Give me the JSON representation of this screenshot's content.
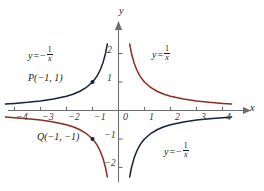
{
  "chart_data": {
    "type": "line",
    "title": "",
    "xlabel": "x",
    "ylabel": "y",
    "xlim": [
      -4.3,
      4.4
    ],
    "ylim": [
      -2.4,
      2.5
    ],
    "grid": false,
    "legend": "none",
    "xticks": [
      -4,
      -3,
      -2,
      -1,
      0,
      1,
      2,
      3,
      4
    ],
    "xtick_labels": [
      "−4",
      "−3",
      "−2",
      "−1",
      "0",
      "1",
      "2",
      "3",
      "4"
    ],
    "yticks": [
      -2,
      -1,
      1,
      2
    ],
    "ytick_labels": [
      "−2",
      "−1",
      "1",
      "2"
    ],
    "series": [
      {
        "name": "y = 1/x",
        "color": "#8e2b22",
        "branch": "x>0",
        "x": [
          0.43,
          0.5,
          0.6,
          0.7,
          0.8,
          0.9,
          1.0,
          1.25,
          1.5,
          1.75,
          2.0,
          2.5,
          3.0,
          3.5,
          4.0,
          4.35
        ],
        "y": [
          2.33,
          2.0,
          1.667,
          1.429,
          1.25,
          1.111,
          1.0,
          0.8,
          0.667,
          0.571,
          0.5,
          0.4,
          0.333,
          0.286,
          0.25,
          0.23
        ]
      },
      {
        "name": "y = 1/x",
        "color": "#8e2b22",
        "branch": "x<0",
        "x": [
          -4.35,
          -4.0,
          -3.5,
          -3.0,
          -2.5,
          -2.0,
          -1.75,
          -1.5,
          -1.25,
          -1.0,
          -0.9,
          -0.8,
          -0.7,
          -0.6,
          -0.5,
          -0.43
        ],
        "y": [
          -0.23,
          -0.25,
          -0.286,
          -0.333,
          -0.4,
          -0.5,
          -0.571,
          -0.667,
          -0.8,
          -1.0,
          -1.111,
          -1.25,
          -1.429,
          -1.667,
          -2.0,
          -2.33
        ]
      },
      {
        "name": "y = -1/x",
        "color": "#16213c",
        "branch": "x<0",
        "x": [
          -4.35,
          -4.0,
          -3.5,
          -3.0,
          -2.5,
          -2.0,
          -1.75,
          -1.5,
          -1.25,
          -1.0,
          -0.9,
          -0.8,
          -0.7,
          -0.6,
          -0.5,
          -0.43
        ],
        "y": [
          0.23,
          0.25,
          0.286,
          0.333,
          0.4,
          0.5,
          0.571,
          0.667,
          0.8,
          1.0,
          1.111,
          1.25,
          1.429,
          1.667,
          2.0,
          2.33
        ]
      },
      {
        "name": "y = -1/x",
        "color": "#16213c",
        "branch": "x>0",
        "x": [
          0.43,
          0.5,
          0.6,
          0.7,
          0.8,
          0.9,
          1.0,
          1.25,
          1.5,
          1.75,
          2.0,
          2.5,
          3.0,
          3.5,
          4.0,
          4.35
        ],
        "y": [
          -2.33,
          -2.0,
          -1.667,
          -1.429,
          -1.25,
          -1.111,
          -1.0,
          -0.8,
          -0.667,
          -0.571,
          -0.5,
          -0.4,
          -0.333,
          -0.286,
          -0.25,
          -0.23
        ]
      }
    ],
    "points": [
      {
        "label": "P(−1, 1)",
        "x": -1,
        "y": 1,
        "color": "#16213c"
      },
      {
        "label": "Q(−1, −1)",
        "x": -1,
        "y": -1,
        "color": "#16213c"
      }
    ],
    "annotations": [
      {
        "id": "label-neg-recip-upper",
        "text": "y = −1/x",
        "sign": "−",
        "x": -2.55,
        "y": 1.7
      },
      {
        "id": "label-recip-upper",
        "text": "y = 1/x",
        "sign": "",
        "x": 1.3,
        "y": 1.73
      },
      {
        "id": "label-neg-recip-lower",
        "text": "y = −1/x",
        "sign": "−",
        "x": 1.85,
        "y": -1.45
      }
    ]
  },
  "axes": {
    "x_axis_label": "x",
    "y_axis_label": "y",
    "equals": "=",
    "y_var": "y",
    "numerator": "1",
    "denominator": "x",
    "minus": "−"
  },
  "colors": {
    "red_curve": "#8e2b22",
    "navy_curve": "#16213c",
    "axis": "#6e6e6e",
    "text": "#1a1a1a"
  },
  "points": {
    "p_label": "P(−1, 1)",
    "q_label": "Q(−1, −1)"
  }
}
